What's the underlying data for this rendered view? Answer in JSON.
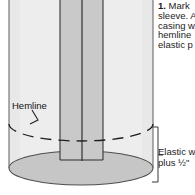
{
  "illustration": {
    "title": "sewing-sleeve-elastic-casing-diagram",
    "colors": {
      "cylinder_fill": "#ededed",
      "cylinder_fill_shadow": "#e2e2e2",
      "strip_fill": "#c9c9c9",
      "base_fill": "#c4c4c4",
      "outline": "#5a5a5a",
      "dark_line": "#2a2a2a",
      "text": "#1c1c1c"
    },
    "labels": {
      "hemline": "Hemline"
    },
    "annotations": {
      "bracket_name": "elastic-width-bracket",
      "hemline_leader_name": "hemline-leader-line",
      "hemline_dash_name": "hemline-dashed-arc"
    }
  },
  "instruction": {
    "step_number": "1.",
    "lines": [
      "Mark",
      "sleeve. A",
      "casing w",
      "hemline",
      "elastic p"
    ],
    "line1_rest": " Mark"
  },
  "elastic_note": {
    "lines": [
      "Elastic w",
      "plus ½\""
    ]
  }
}
